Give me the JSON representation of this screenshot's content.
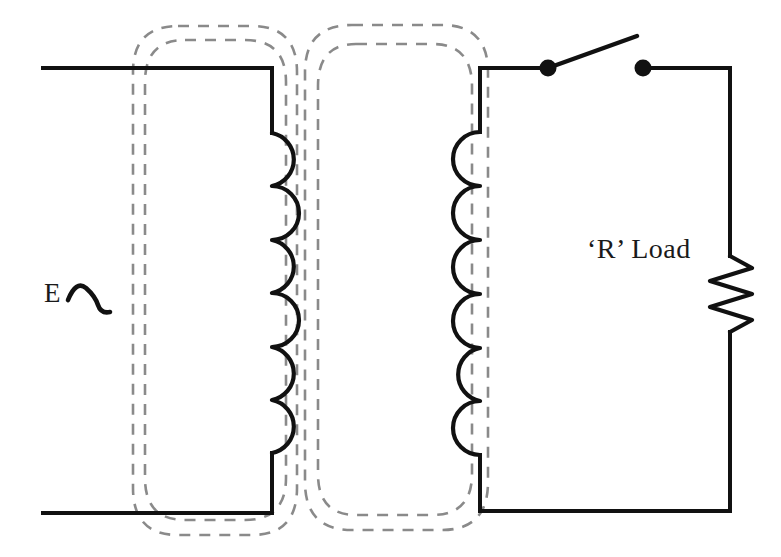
{
  "diagram": {
    "background_color": "#ffffff",
    "wire_color": "#111111",
    "flux_color": "#8a8a8a",
    "labels": {
      "source": "E",
      "load": "‘R’ Load"
    },
    "components": {
      "ac_source": {
        "name": "AC voltage source",
        "symbol": "sine-wave",
        "label": "E"
      },
      "primary_winding": {
        "name": "Transformer primary coil",
        "turns": 6,
        "side": "left"
      },
      "secondary_winding": {
        "name": "Transformer secondary coil",
        "turns": 6,
        "side": "right"
      },
      "switch": {
        "name": "Single pole single throw switch",
        "state": "open",
        "terminals": 2
      },
      "resistor": {
        "name": "Load resistor",
        "symbol": "zigzag",
        "label": "‘R’ Load",
        "peaks": 6
      },
      "flux_lines": {
        "name": "Magnetic flux lines",
        "style": "dashed",
        "loop_count": 4
      }
    }
  }
}
